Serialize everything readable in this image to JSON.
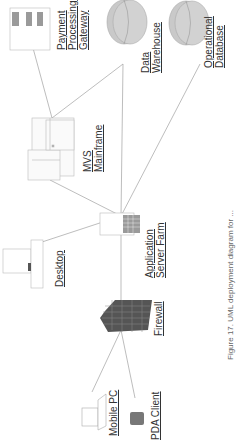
{
  "diagram": {
    "nodes": [
      {
        "id": "payment",
        "label_lines": [
          "Payment",
          "Processing",
          "Gateway"
        ],
        "icon": "server-rack-icon"
      },
      {
        "id": "datawarehouse",
        "label_lines": [
          "Data",
          "Warehouse"
        ],
        "icon": "database-cylinder-icon"
      },
      {
        "id": "opdb",
        "label_lines": [
          "Operational",
          "Database"
        ],
        "icon": "database-cylinder-icon"
      },
      {
        "id": "mainframe",
        "label_lines": [
          "MVS",
          "Mainframe"
        ],
        "icon": "mainframe-icon"
      },
      {
        "id": "desktop",
        "label_lines": [
          "Desktop"
        ],
        "icon": "desktop-computer-icon"
      },
      {
        "id": "appserver",
        "label_lines": [
          "Application",
          "Server Farm"
        ],
        "icon": "server-tower-icon"
      },
      {
        "id": "firewall",
        "label_lines": [
          "Firewall"
        ],
        "icon": "brick-wall-icon"
      },
      {
        "id": "mobile",
        "label_lines": [
          "Mobile PC"
        ],
        "icon": "laptop-icon"
      },
      {
        "id": "pda",
        "label_lines": [
          "PDA Client"
        ],
        "icon": "pda-icon"
      }
    ],
    "edges": [
      [
        "payment",
        "mainframe"
      ],
      [
        "mainframe",
        "datawarehouse"
      ],
      [
        "mainframe",
        "appserver"
      ],
      [
        "datawarehouse",
        "appserver"
      ],
      [
        "opdb",
        "appserver"
      ],
      [
        "desktop",
        "appserver"
      ],
      [
        "appserver",
        "firewall"
      ],
      [
        "firewall",
        "mobile"
      ],
      [
        "firewall",
        "pda"
      ]
    ],
    "orientation": "rotated -90deg",
    "caption": "Figure 17. UML deployment diagram for ..."
  },
  "colors": {
    "line": "#9a9a9a",
    "db_fill": "#c8c8c8",
    "firewall": "#555555",
    "text": "#333333"
  }
}
